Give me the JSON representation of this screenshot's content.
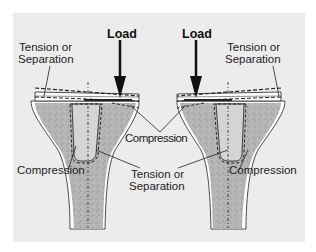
{
  "diagram": {
    "colors": {
      "background": "#ececec",
      "bone_fill": "#b8b8b8",
      "canal_fill": "#cfcfcf",
      "outline": "#222222",
      "implant": "#ffffff"
    },
    "left_knee": {
      "load_label": "Load",
      "tension_label": "Tension or\nSeparation",
      "tension_line1": "Tension or",
      "tension_line2": "Separation",
      "compression_label": "Compression"
    },
    "right_knee": {
      "load_label": "Load",
      "tension_line1": "Tension or",
      "tension_line2": "Separation",
      "compression_label": "Compression"
    },
    "center": {
      "compression_label": "Compression",
      "tension_line1": "Tension or",
      "tension_line2": "Separation"
    }
  }
}
